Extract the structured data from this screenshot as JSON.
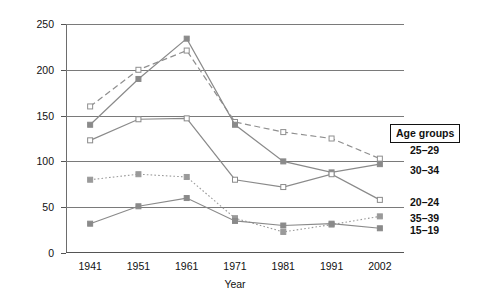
{
  "chart_data": {
    "type": "line",
    "title": "",
    "xlabel": "Year",
    "ylabel": "Births per 1000 women",
    "x": [
      1941,
      1951,
      1961,
      1971,
      1981,
      1991,
      2002
    ],
    "categories": [
      "1941",
      "1951",
      "1961",
      "1971",
      "1981",
      "1991",
      "2002"
    ],
    "xticklabels": [
      "1941",
      "1951",
      "1961",
      "1971",
      "1981",
      "1991",
      "2002"
    ],
    "yticklabels": [
      "0",
      "50",
      "100",
      "150",
      "200",
      "250"
    ],
    "yticks": [
      0,
      50,
      100,
      150,
      200,
      250
    ],
    "ylim": [
      0,
      250
    ],
    "grid": "horizontal",
    "legend_position": "right",
    "legend_title": "Age groups",
    "series": [
      {
        "name": "25–29",
        "values": [
          160,
          200,
          221,
          143,
          132,
          125,
          103
        ],
        "linestyle": "dashed",
        "marker": "open-square",
        "color": "#8f8f8f"
      },
      {
        "name": "30–34",
        "values": [
          140,
          190,
          234,
          140,
          100,
          88,
          97
        ],
        "linestyle": "solid",
        "marker": "filled-square",
        "color": "#8a8a8a"
      },
      {
        "name": "20–24",
        "values": [
          123,
          146,
          147,
          80,
          72,
          86,
          58
        ],
        "linestyle": "solid",
        "marker": "open-square",
        "color": "#8a8a8a"
      },
      {
        "name": "35–39",
        "values": [
          80,
          86,
          83,
          38,
          23,
          31,
          40
        ],
        "linestyle": "dotted",
        "marker": "filled-square",
        "color": "#9a9a9a"
      },
      {
        "name": "15–19",
        "values": [
          32,
          51,
          60,
          35,
          30,
          32,
          27
        ],
        "linestyle": "solid",
        "marker": "filled-square",
        "color": "#8a8a8a"
      }
    ]
  },
  "legend": {
    "title": "Age groups",
    "entries": [
      {
        "label": "25–29"
      },
      {
        "label": "30–34"
      },
      {
        "label": "20–24"
      },
      {
        "label": "35–39"
      },
      {
        "label": "15–19"
      }
    ]
  },
  "colors": {
    "line": "#8a8a8a",
    "grid": "#7a7a7a",
    "axis": "#555555",
    "text": "#111111",
    "background": "#ffffff"
  }
}
